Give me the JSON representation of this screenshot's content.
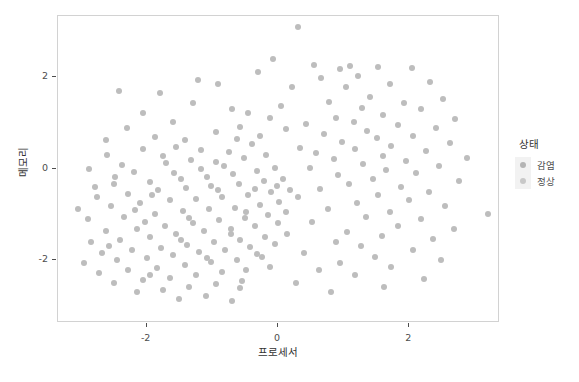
{
  "chart_data": {
    "type": "scatter",
    "title": "",
    "xlabel": "프로세서",
    "ylabel": "메모리",
    "xlim": [
      -3.35,
      3.35
    ],
    "ylim": [
      -3.35,
      3.35
    ],
    "xticks": [
      "-2",
      "0",
      "2"
    ],
    "xtick_values": [
      -2,
      0,
      2
    ],
    "yticks": [
      "2",
      "0",
      "-2"
    ],
    "ytick_values": [
      2,
      0,
      -2
    ],
    "grid": false,
    "legend": {
      "title": "상태",
      "position": "right",
      "entries": [
        {
          "label": "감염",
          "color": "#b4b4b4"
        },
        {
          "label": "정상",
          "color": "#c8c8c8"
        }
      ]
    },
    "point_color": "#bdbdbd",
    "point_size": 6,
    "series": [
      {
        "name": "감염",
        "points": [
          [
            0.31,
            3.1
          ],
          [
            -0.08,
            2.4
          ],
          [
            0.55,
            2.28
          ],
          [
            1.1,
            2.26
          ],
          [
            1.52,
            2.22
          ],
          [
            2.04,
            2.21
          ],
          [
            0.95,
            2.19
          ],
          [
            -0.3,
            2.13
          ],
          [
            1.22,
            2.04
          ],
          [
            0.66,
            1.98
          ],
          [
            -1.22,
            1.94
          ],
          [
            2.32,
            1.9
          ],
          [
            1.7,
            1.86
          ],
          [
            1.03,
            1.8
          ],
          [
            0.22,
            1.78
          ],
          [
            -1.8,
            1.66
          ],
          [
            1.4,
            1.58
          ],
          [
            2.52,
            1.52
          ],
          [
            0.78,
            1.46
          ],
          [
            1.92,
            1.44
          ],
          [
            0.05,
            1.38
          ],
          [
            1.28,
            1.32
          ],
          [
            2.18,
            1.3
          ],
          [
            -0.46,
            1.22
          ],
          [
            1.6,
            1.18
          ],
          [
            0.88,
            1.12
          ],
          [
            2.7,
            1.08
          ],
          [
            1.15,
            1.02
          ],
          [
            0.42,
            0.98
          ],
          [
            1.82,
            0.95
          ],
          [
            2.4,
            0.9
          ],
          [
            0.12,
            0.86
          ],
          [
            1.36,
            0.82
          ],
          [
            0.7,
            0.76
          ],
          [
            2.05,
            0.72
          ],
          [
            1.5,
            0.68
          ],
          [
            -0.62,
            0.64
          ],
          [
            0.98,
            0.58
          ],
          [
            2.62,
            0.55
          ],
          [
            1.72,
            0.5
          ],
          [
            0.34,
            0.46
          ],
          [
            1.18,
            0.42
          ],
          [
            2.26,
            0.38
          ],
          [
            0.58,
            0.33
          ],
          [
            1.6,
            0.28
          ],
          [
            2.88,
            0.24
          ],
          [
            0.85,
            0.2
          ],
          [
            1.95,
            0.16
          ],
          [
            1.3,
            0.1
          ],
          [
            2.45,
            0.05
          ],
          [
            0.48,
            0.02
          ],
          [
            1.65,
            -0.04
          ],
          [
            2.1,
            -0.1
          ],
          [
            0.92,
            -0.15
          ],
          [
            1.44,
            -0.22
          ],
          [
            2.75,
            -0.28
          ],
          [
            1.08,
            -0.34
          ],
          [
            1.88,
            -0.4
          ],
          [
            0.64,
            -0.46
          ],
          [
            2.3,
            -0.52
          ],
          [
            1.52,
            -0.58
          ],
          [
            0.3,
            -0.63
          ],
          [
            2.0,
            -0.7
          ],
          [
            1.2,
            -0.76
          ],
          [
            2.55,
            -0.82
          ],
          [
            0.76,
            -0.88
          ],
          [
            1.7,
            -0.95
          ],
          [
            3.2,
            -1.0
          ],
          [
            1.34,
            -1.06
          ],
          [
            2.18,
            -1.12
          ],
          [
            0.52,
            -1.18
          ],
          [
            1.82,
            -1.26
          ],
          [
            2.68,
            -1.32
          ],
          [
            1.05,
            -1.4
          ],
          [
            1.58,
            -1.48
          ],
          [
            2.36,
            -1.55
          ],
          [
            0.88,
            -1.62
          ],
          [
            1.26,
            -1.7
          ],
          [
            2.05,
            -1.78
          ],
          [
            0.4,
            -1.86
          ],
          [
            1.48,
            -1.94
          ],
          [
            2.48,
            -2.0
          ],
          [
            0.95,
            -2.08
          ],
          [
            1.72,
            -2.16
          ],
          [
            0.62,
            -2.24
          ],
          [
            1.18,
            -2.34
          ],
          [
            2.22,
            -2.42
          ],
          [
            0.28,
            -2.52
          ],
          [
            1.62,
            -2.6
          ],
          [
            0.8,
            -2.72
          ]
        ]
      },
      {
        "name": "정상",
        "points": [
          [
            -2.42,
            1.7
          ],
          [
            -0.92,
            1.85
          ],
          [
            -2.05,
            0.42
          ],
          [
            -2.6,
            0.3
          ],
          [
            -1.55,
            0.48
          ],
          [
            -1.18,
            0.4
          ],
          [
            -0.75,
            0.36
          ],
          [
            -2.88,
            -0.02
          ],
          [
            -2.2,
            -0.08
          ],
          [
            -1.7,
            0.12
          ],
          [
            -1.32,
            0.18
          ],
          [
            -0.95,
            0.14
          ],
          [
            -0.52,
            0.22
          ],
          [
            -0.18,
            0.3
          ],
          [
            -2.5,
            -0.35
          ],
          [
            -1.95,
            -0.3
          ],
          [
            -1.48,
            -0.24
          ],
          [
            -1.08,
            -0.18
          ],
          [
            -0.68,
            -0.12
          ],
          [
            -0.32,
            -0.06
          ],
          [
            -0.05,
            0.02
          ],
          [
            -2.75,
            -0.62
          ],
          [
            -2.28,
            -0.55
          ],
          [
            -1.82,
            -0.48
          ],
          [
            -1.4,
            -0.42
          ],
          [
            -1.02,
            -0.38
          ],
          [
            -0.6,
            -0.34
          ],
          [
            -0.22,
            -0.28
          ],
          [
            0.08,
            -0.22
          ],
          [
            -3.05,
            -0.88
          ],
          [
            -2.55,
            -0.82
          ],
          [
            -2.1,
            -0.76
          ],
          [
            -1.65,
            -0.7
          ],
          [
            -1.25,
            -0.66
          ],
          [
            -0.85,
            -0.62
          ],
          [
            -0.45,
            -0.58
          ],
          [
            -0.1,
            -0.52
          ],
          [
            0.18,
            -0.48
          ],
          [
            -2.9,
            -1.12
          ],
          [
            -2.35,
            -1.06
          ],
          [
            -1.88,
            -1.0
          ],
          [
            -1.45,
            -0.94
          ],
          [
            -1.05,
            -0.9
          ],
          [
            -0.65,
            -0.86
          ],
          [
            -0.28,
            -0.8
          ],
          [
            0.02,
            -0.74
          ],
          [
            -2.62,
            -1.38
          ],
          [
            -2.15,
            -1.32
          ],
          [
            -1.72,
            -1.26
          ],
          [
            -1.3,
            -1.2
          ],
          [
            -0.9,
            -1.14
          ],
          [
            -0.5,
            -1.08
          ],
          [
            -0.15,
            -1.02
          ],
          [
            0.12,
            -0.96
          ],
          [
            -2.85,
            -1.62
          ],
          [
            -2.4,
            -1.56
          ],
          [
            -1.95,
            -1.5
          ],
          [
            -1.55,
            -1.44
          ],
          [
            -1.12,
            -1.38
          ],
          [
            -0.72,
            -1.32
          ],
          [
            -0.35,
            -1.26
          ],
          [
            0.0,
            -1.2
          ],
          [
            -2.68,
            -1.86
          ],
          [
            -2.22,
            -1.8
          ],
          [
            -1.78,
            -1.74
          ],
          [
            -1.38,
            -1.68
          ],
          [
            -0.98,
            -1.62
          ],
          [
            -0.58,
            -1.56
          ],
          [
            -0.2,
            -1.5
          ],
          [
            0.14,
            -1.44
          ],
          [
            -2.95,
            -2.08
          ],
          [
            -2.45,
            -2.02
          ],
          [
            -2.0,
            -1.96
          ],
          [
            -1.6,
            -1.9
          ],
          [
            -1.2,
            -1.84
          ],
          [
            -0.8,
            -1.78
          ],
          [
            -0.42,
            -1.72
          ],
          [
            -0.05,
            -1.66
          ],
          [
            -2.72,
            -2.3
          ],
          [
            -2.28,
            -2.24
          ],
          [
            -1.85,
            -2.18
          ],
          [
            -1.42,
            -2.12
          ],
          [
            -1.02,
            -2.06
          ],
          [
            -0.62,
            -2.0
          ],
          [
            -0.25,
            -1.94
          ],
          [
            -2.5,
            -2.52
          ],
          [
            -2.05,
            -2.46
          ],
          [
            -1.65,
            -2.4
          ],
          [
            -1.25,
            -2.34
          ],
          [
            -0.85,
            -2.28
          ],
          [
            -0.48,
            -2.22
          ],
          [
            -0.12,
            -2.16
          ],
          [
            -2.15,
            -2.72
          ],
          [
            -1.75,
            -2.66
          ],
          [
            -1.35,
            -2.6
          ],
          [
            -0.95,
            -2.54
          ],
          [
            -0.55,
            -2.48
          ],
          [
            -1.5,
            -2.86
          ],
          [
            -1.1,
            -2.8
          ],
          [
            -0.7,
            -2.92
          ],
          [
            -2.3,
            0.88
          ],
          [
            -1.88,
            0.7
          ],
          [
            -1.42,
            0.62
          ],
          [
            -0.28,
            0.72
          ],
          [
            -0.58,
            0.92
          ],
          [
            -0.95,
            0.8
          ],
          [
            -1.6,
            1.02
          ],
          [
            -0.12,
            1.1
          ],
          [
            -2.05,
            1.22
          ],
          [
            -0.7,
            1.3
          ],
          [
            -1.3,
            1.44
          ],
          [
            -2.62,
            0.62
          ],
          [
            -0.4,
            0.54
          ],
          [
            -1.75,
            0.28
          ],
          [
            -2.38,
            0.08
          ],
          [
            -0.82,
            0.06
          ],
          [
            -1.18,
            -0.02
          ],
          [
            -2.48,
            -0.18
          ],
          [
            -0.35,
            -0.44
          ],
          [
            -1.92,
            -0.58
          ],
          [
            -2.78,
            -0.4
          ],
          [
            -0.02,
            -0.38
          ],
          [
            -1.58,
            -0.1
          ],
          [
            -0.92,
            -0.48
          ],
          [
            -2.18,
            -0.92
          ],
          [
            -0.48,
            -0.96
          ],
          [
            -1.35,
            -1.08
          ],
          [
            -2.02,
            -1.18
          ],
          [
            -0.72,
            -1.44
          ],
          [
            -1.48,
            -1.56
          ],
          [
            -2.58,
            -1.7
          ],
          [
            -0.32,
            -1.88
          ],
          [
            -1.08,
            -1.96
          ],
          [
            -1.95,
            -2.34
          ],
          [
            -0.58,
            -2.62
          ]
        ]
      }
    ]
  },
  "caption": {
    "text": ""
  }
}
